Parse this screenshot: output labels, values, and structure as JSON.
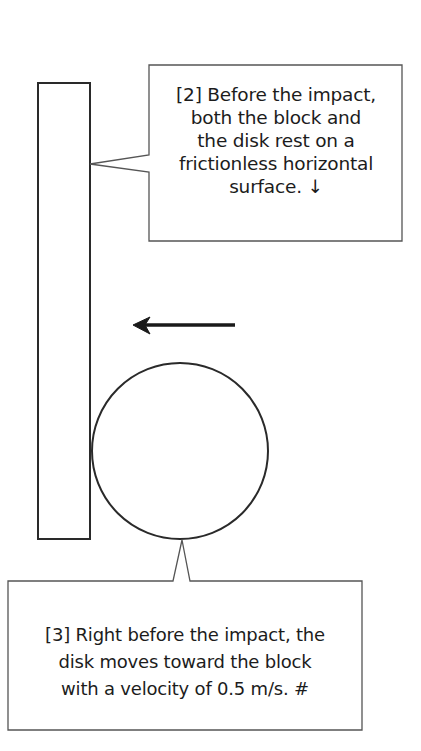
{
  "diagram": {
    "type": "physics-collision-illustration",
    "colors": {
      "stroke": "#2a2a2a",
      "callout_stroke": "#555555",
      "background": "#ffffff",
      "text": "#1c1c1c"
    },
    "block": {
      "shape": "rectangle",
      "x": 38,
      "y": 83,
      "width": 52,
      "height": 456
    },
    "disk": {
      "shape": "circle",
      "cx": 180,
      "cy": 451,
      "r": 88
    },
    "velocity_arrow": {
      "direction": "left",
      "x_start": 235,
      "x_end": 133,
      "y": 325
    },
    "callouts": [
      {
        "id": "2",
        "label": "[2]",
        "lines": [
          "[2] Before the impact,",
          "both the block and",
          "the disk rest on a",
          "frictionless horizontal",
          "surface. ↓"
        ],
        "points_to": "block"
      },
      {
        "id": "3",
        "label": "[3]",
        "lines": [
          "[3] Right before the impact, the",
          "disk moves toward the block",
          "with a velocity of 0.5 m/s.  #"
        ],
        "points_to": "disk"
      }
    ]
  }
}
